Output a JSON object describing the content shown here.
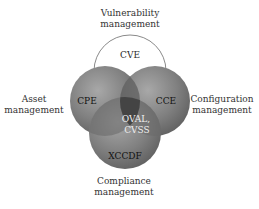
{
  "diagram": {
    "domains": {
      "top": [
        "Vulnerability",
        "management"
      ],
      "left": [
        "Asset",
        "management"
      ],
      "right": [
        "Configuration",
        "management"
      ],
      "bottom": [
        "Compliance",
        "management"
      ]
    },
    "circles": [
      {
        "id": "cve",
        "label": "CVE",
        "fill": "#ffffff",
        "stroke": "#8a8a8a"
      },
      {
        "id": "cpe",
        "label": "CPE",
        "fill": "#7a7a7a",
        "stroke": "#6a6a6a"
      },
      {
        "id": "cce",
        "label": "CCE",
        "fill": "#7a7a7a",
        "stroke": "#6a6a6a"
      },
      {
        "id": "xccdf",
        "label": "XCCDF",
        "fill": "#7a7a7a",
        "stroke": "#6a6a6a"
      }
    ],
    "center_label": [
      "OVAL,",
      "CVSS"
    ],
    "colors": {
      "circle_gray": "#7a7a7a",
      "overlap_dark": "#4a4a4a",
      "center_text": "#f0f0f0",
      "label_text": "#1a1a1a"
    }
  }
}
